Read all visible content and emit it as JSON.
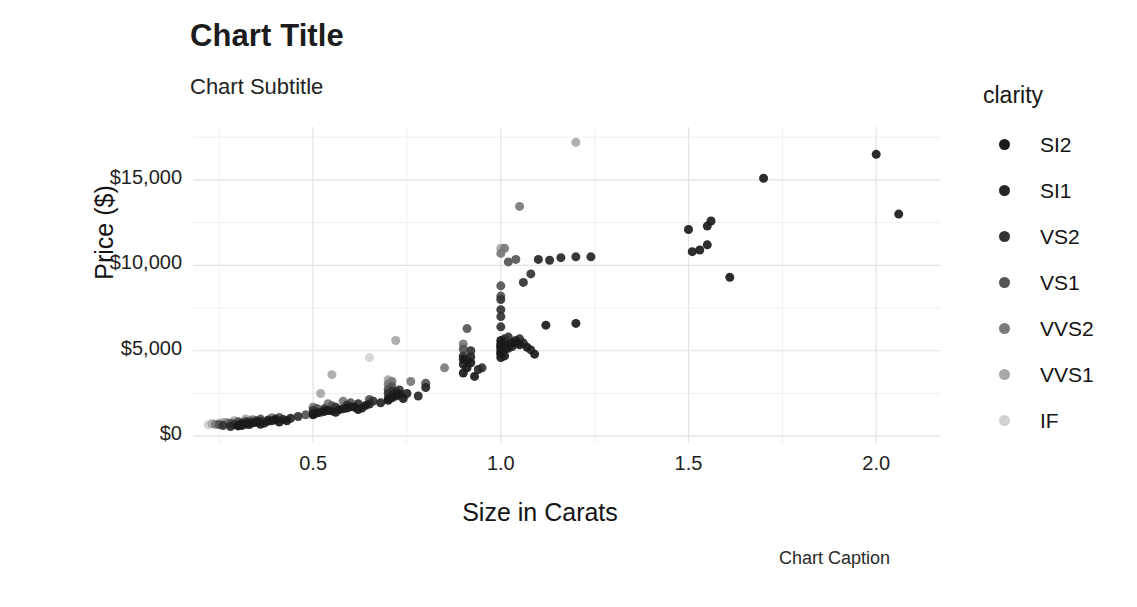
{
  "titles": {
    "title": "Chart Title",
    "subtitle": "Chart Subtitle",
    "caption": "Chart Caption"
  },
  "legend": {
    "title": "clarity",
    "position": "right",
    "items": [
      {
        "label": "SI2",
        "color": "#1a1a1a"
      },
      {
        "label": "SI1",
        "color": "#262626"
      },
      {
        "label": "VS2",
        "color": "#333333"
      },
      {
        "label": "VS1",
        "color": "#555555"
      },
      {
        "label": "VVS2",
        "color": "#7a7a7a"
      },
      {
        "label": "VVS1",
        "color": "#a8a8a8"
      },
      {
        "label": "IF",
        "color": "#d2d2d2"
      }
    ]
  },
  "chart_data": {
    "type": "scatter",
    "title": "Chart Title",
    "subtitle": "Chart Subtitle",
    "caption": "Chart Caption",
    "xlabel": "Size in Carats",
    "ylabel": "Price ($)",
    "xlim": [
      0.18,
      2.17
    ],
    "ylim": [
      -400,
      18100
    ],
    "xticks": [
      0.5,
      1.0,
      1.5,
      2.0
    ],
    "xticklabels": [
      "0.5",
      "1.0",
      "1.5",
      "2.0"
    ],
    "yticks": [
      0,
      5000,
      10000,
      15000
    ],
    "yticklabels": [
      "$0",
      "$5,000",
      "$10,000",
      "$15,000"
    ],
    "y_minor_ticks": [
      2500,
      7500,
      12500,
      17500
    ],
    "x_minor_ticks": [
      0.25,
      0.75,
      1.25,
      1.75
    ],
    "grid": true,
    "grid_color": "#e4e4e4",
    "marker_size": 9,
    "legend_key": "clarity",
    "series": [
      {
        "name": "SI2",
        "color": "#1a1a1a",
        "points": [
          [
            0.3,
            600
          ],
          [
            0.31,
            620
          ],
          [
            0.32,
            700
          ],
          [
            0.33,
            760
          ],
          [
            0.35,
            820
          ],
          [
            0.36,
            700
          ],
          [
            0.38,
            880
          ],
          [
            0.4,
            950
          ],
          [
            0.41,
            830
          ],
          [
            0.43,
            900
          ],
          [
            0.5,
            1300
          ],
          [
            0.51,
            1350
          ],
          [
            0.53,
            1450
          ],
          [
            0.54,
            1500
          ],
          [
            0.56,
            1400
          ],
          [
            0.57,
            1550
          ],
          [
            0.59,
            1650
          ],
          [
            0.61,
            1700
          ],
          [
            0.62,
            1560
          ],
          [
            0.64,
            1800
          ],
          [
            0.7,
            2100
          ],
          [
            0.71,
            2250
          ],
          [
            0.72,
            2350
          ],
          [
            0.73,
            2450
          ],
          [
            0.74,
            2200
          ],
          [
            0.9,
            3700
          ],
          [
            0.91,
            4000
          ],
          [
            0.92,
            4300
          ],
          [
            0.9,
            4500
          ],
          [
            0.93,
            3500
          ],
          [
            1.0,
            4600
          ],
          [
            1.0,
            4900
          ],
          [
            1.0,
            5200
          ],
          [
            1.0,
            5400
          ],
          [
            1.0,
            5600
          ],
          [
            1.01,
            5100
          ],
          [
            1.01,
            4700
          ],
          [
            1.02,
            5300
          ],
          [
            1.03,
            5450
          ],
          [
            1.04,
            5500
          ],
          [
            1.05,
            5350
          ],
          [
            1.07,
            5200
          ],
          [
            1.09,
            4800
          ],
          [
            1.12,
            6500
          ],
          [
            1.2,
            6600
          ],
          [
            1.5,
            12100
          ],
          [
            1.51,
            10800
          ],
          [
            1.53,
            10900
          ],
          [
            1.55,
            12300
          ],
          [
            1.56,
            12600
          ],
          [
            1.55,
            11200
          ],
          [
            1.61,
            9300
          ],
          [
            1.7,
            15100
          ],
          [
            2.0,
            16500
          ],
          [
            2.06,
            13000
          ]
        ]
      },
      {
        "name": "SI1",
        "color": "#262626",
        "points": [
          [
            0.28,
            560
          ],
          [
            0.3,
            640
          ],
          [
            0.31,
            720
          ],
          [
            0.33,
            680
          ],
          [
            0.34,
            780
          ],
          [
            0.36,
            860
          ],
          [
            0.37,
            760
          ],
          [
            0.39,
            900
          ],
          [
            0.42,
            980
          ],
          [
            0.44,
            1050
          ],
          [
            0.5,
            1250
          ],
          [
            0.52,
            1400
          ],
          [
            0.55,
            1480
          ],
          [
            0.58,
            1600
          ],
          [
            0.6,
            1720
          ],
          [
            0.63,
            1650
          ],
          [
            0.65,
            1880
          ],
          [
            0.68,
            1950
          ],
          [
            0.7,
            2200
          ],
          [
            0.71,
            2400
          ],
          [
            0.72,
            2550
          ],
          [
            0.75,
            2500
          ],
          [
            0.78,
            2350
          ],
          [
            0.8,
            2850
          ],
          [
            0.9,
            4200
          ],
          [
            0.91,
            4450
          ],
          [
            0.92,
            4650
          ],
          [
            0.94,
            3900
          ],
          [
            1.0,
            4800
          ],
          [
            1.0,
            5050
          ],
          [
            1.0,
            5300
          ],
          [
            1.01,
            5500
          ],
          [
            1.02,
            5150
          ],
          [
            1.03,
            5250
          ],
          [
            1.04,
            5600
          ],
          [
            1.06,
            5450
          ],
          [
            1.08,
            5050
          ],
          [
            1.1,
            10350
          ],
          [
            1.13,
            10300
          ],
          [
            1.16,
            10450
          ],
          [
            1.2,
            10500
          ],
          [
            1.24,
            10500
          ]
        ]
      },
      {
        "name": "VS2",
        "color": "#333333",
        "points": [
          [
            0.26,
            620
          ],
          [
            0.29,
            700
          ],
          [
            0.31,
            760
          ],
          [
            0.32,
            840
          ],
          [
            0.34,
            800
          ],
          [
            0.35,
            900
          ],
          [
            0.38,
            950
          ],
          [
            0.4,
            1000
          ],
          [
            0.46,
            1150
          ],
          [
            0.5,
            1500
          ],
          [
            0.53,
            1600
          ],
          [
            0.56,
            1700
          ],
          [
            0.59,
            1820
          ],
          [
            0.62,
            1900
          ],
          [
            0.66,
            2050
          ],
          [
            0.7,
            2500
          ],
          [
            0.71,
            2650
          ],
          [
            0.73,
            2700
          ],
          [
            0.9,
            4700
          ],
          [
            0.92,
            5000
          ],
          [
            0.95,
            4000
          ],
          [
            1.0,
            6400
          ],
          [
            1.0,
            7000
          ],
          [
            1.0,
            7400
          ],
          [
            1.0,
            8000
          ],
          [
            1.01,
            5700
          ],
          [
            1.02,
            5800
          ],
          [
            1.05,
            5700
          ],
          [
            1.06,
            9000
          ],
          [
            1.08,
            9500
          ]
        ]
      },
      {
        "name": "VS1",
        "color": "#555555",
        "points": [
          [
            0.25,
            680
          ],
          [
            0.28,
            760
          ],
          [
            0.3,
            820
          ],
          [
            0.33,
            880
          ],
          [
            0.36,
            1000
          ],
          [
            0.41,
            1100
          ],
          [
            0.48,
            1250
          ],
          [
            0.51,
            1620
          ],
          [
            0.55,
            1780
          ],
          [
            0.6,
            1950
          ],
          [
            0.65,
            2150
          ],
          [
            0.7,
            2750
          ],
          [
            0.71,
            2900
          ],
          [
            0.72,
            2600
          ],
          [
            0.8,
            3100
          ],
          [
            0.9,
            5100
          ],
          [
            0.91,
            6300
          ],
          [
            1.0,
            8200
          ],
          [
            1.0,
            8800
          ],
          [
            1.02,
            10200
          ],
          [
            1.04,
            10350
          ]
        ]
      },
      {
        "name": "VVS2",
        "color": "#7a7a7a",
        "points": [
          [
            0.24,
            700
          ],
          [
            0.27,
            790
          ],
          [
            0.3,
            860
          ],
          [
            0.34,
            960
          ],
          [
            0.39,
            1080
          ],
          [
            0.5,
            1700
          ],
          [
            0.54,
            1900
          ],
          [
            0.58,
            2050
          ],
          [
            0.7,
            3050
          ],
          [
            0.71,
            3200
          ],
          [
            0.76,
            3200
          ],
          [
            0.85,
            4000
          ],
          [
            0.9,
            5400
          ],
          [
            1.0,
            10700
          ],
          [
            1.01,
            11000
          ],
          [
            1.05,
            13450
          ]
        ]
      },
      {
        "name": "VVS1",
        "color": "#a8a8a8",
        "points": [
          [
            0.23,
            720
          ],
          [
            0.26,
            800
          ],
          [
            0.29,
            900
          ],
          [
            0.32,
            1000
          ],
          [
            0.52,
            2500
          ],
          [
            0.55,
            3600
          ],
          [
            0.7,
            3300
          ],
          [
            0.72,
            5600
          ],
          [
            1.0,
            11000
          ],
          [
            1.2,
            17200
          ]
        ]
      },
      {
        "name": "IF",
        "color": "#d2d2d2",
        "points": [
          [
            0.22,
            660
          ],
          [
            0.25,
            780
          ],
          [
            0.33,
            960
          ],
          [
            0.65,
            4600
          ]
        ]
      }
    ]
  }
}
